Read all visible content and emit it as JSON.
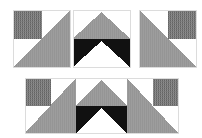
{
  "figure": {
    "background_color": "#ffffff",
    "colors": {
      "gray": "#9a9a9a",
      "black": "#111111",
      "white": "#ffffff",
      "hatch_dark": "#6e6e6e",
      "hatch_light": "#8f8f8f",
      "outline": "#d8d8d8"
    },
    "top_row": {
      "name": "individual-tiles-row",
      "tiles": [
        {
          "id": "tile-a",
          "label": "Tile A",
          "x": 13,
          "y": 10,
          "size": 57,
          "parts": [
            "hatched-square-top-left",
            "gray-triangle-bottom-right",
            "white-background"
          ]
        },
        {
          "id": "tile-b",
          "label": "Tile B",
          "x": 73,
          "y": 10,
          "size": 57,
          "parts": [
            "gray-chevron-top",
            "black-band-bottom",
            "white-triangle-bottom"
          ]
        },
        {
          "id": "tile-c",
          "label": "Tile C",
          "x": 139,
          "y": 10,
          "size": 57,
          "parts": [
            "hatched-square-top-right",
            "gray-triangle-bottom-left",
            "white-background"
          ]
        }
      ]
    },
    "bottom_strip": {
      "name": "composite-strip",
      "x": 25,
      "y": 78,
      "width": 153,
      "height": 55,
      "tile_order": [
        "Tile A",
        "Tile B",
        "Tile C"
      ],
      "tile_count": 3
    }
  }
}
